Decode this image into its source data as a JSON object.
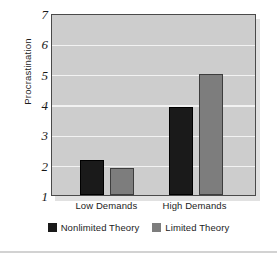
{
  "chart_data": {
    "type": "bar",
    "title": "",
    "subtitle": "",
    "xlabel": "",
    "ylabel": "Procrastination",
    "categories": [
      "Low Demands",
      "High Demands"
    ],
    "series": [
      {
        "name": "Nonlimited Theory",
        "color": "#1a1a1a",
        "values": [
          2.15,
          3.9
        ]
      },
      {
        "name": "Limited Theory",
        "color": "#7d7d7d",
        "values": [
          1.9,
          5.0
        ]
      }
    ],
    "ylim": [
      1,
      7
    ],
    "yticks": [
      1,
      2,
      3,
      4,
      5,
      6,
      7
    ],
    "ytick_labels": [
      "1",
      "2",
      "3",
      "4",
      "5",
      "6",
      "7"
    ],
    "grid": true,
    "grid_color": "#f2f2f2",
    "legend_position": "bottom",
    "plot_background": "#cdcdcd",
    "axis_color": "#4a4a4a"
  }
}
